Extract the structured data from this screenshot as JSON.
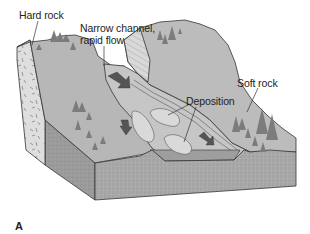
{
  "figure": {
    "panel_label": "A",
    "labels": {
      "hard_rock": "Hard rock",
      "narrow_channel_line1": "Narrow channel,",
      "narrow_channel_line2": "rapid flow",
      "soft_rock": "Soft rock",
      "deposition": "Deposition"
    },
    "colors": {
      "background": "#ffffff",
      "land_surface": "#b9b9b9",
      "hard_rock_face": "#dcdcdc",
      "cliff_face": "#d6d6d6",
      "front_block_face": "#a8a8a8",
      "side_block_face": "#9a9a9a",
      "water": "#c4c4c4",
      "deposition_bars": "#d8d8d8",
      "trees": "#7d7d7d",
      "flow_arrows": "#555555",
      "outline": "#333333"
    }
  }
}
